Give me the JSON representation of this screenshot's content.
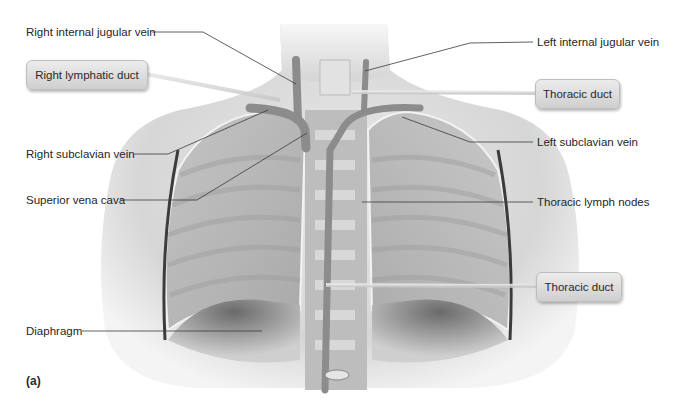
{
  "figure": {
    "panel_label": "(a)",
    "labels_left": [
      {
        "id": "right-internal-jugular-vein",
        "text": "Right internal jugular vein"
      },
      {
        "id": "right-subclavian-vein",
        "text": "Right subclavian vein"
      },
      {
        "id": "superior-vena-cava",
        "text": "Superior vena cava"
      },
      {
        "id": "diaphragm",
        "text": "Diaphragm"
      }
    ],
    "labels_right": [
      {
        "id": "left-internal-jugular-vein",
        "text": "Left internal jugular vein"
      },
      {
        "id": "left-subclavian-vein",
        "text": "Left subclavian vein"
      },
      {
        "id": "thoracic-lymph-nodes",
        "text": "Thoracic lymph nodes"
      }
    ],
    "callouts": [
      {
        "id": "right-lymphatic-duct",
        "text": "Right lymphatic duct"
      },
      {
        "id": "thoracic-duct-upper",
        "text": "Thoracic duct"
      },
      {
        "id": "thoracic-duct-lower",
        "text": "Thoracic duct"
      }
    ],
    "colors": {
      "background": "#ffffff",
      "skin": "#d9d9d9",
      "lung": "#b9b9b9",
      "leader_line": "#3a3a3a",
      "callout_fill": "#dcdcdc"
    }
  }
}
